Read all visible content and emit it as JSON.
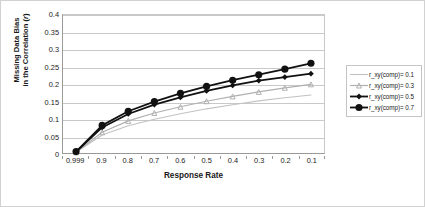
{
  "chart_data": {
    "type": "line",
    "title": "",
    "xlabel": "Response Rate",
    "ylabel_line1": "Missing Data Bias",
    "ylabel_line2": "in the Correlation (r)",
    "ylabel": "Missing Data Bias in the Correlation (r)",
    "categories": [
      "0.999",
      "0.9",
      "0.8",
      "0.7",
      "0.6",
      "0.5",
      "0.4",
      "0.3",
      "0.2",
      "0.1"
    ],
    "ylim": [
      0,
      0.4
    ],
    "yticks": [
      "0",
      "0.05",
      "0.1",
      "0.15",
      "0.2",
      "0.25",
      "0.3",
      "0.35",
      "0.4"
    ],
    "ytick_values": [
      0,
      0.05,
      0.1,
      0.15,
      0.2,
      0.25,
      0.3,
      0.35,
      0.4
    ],
    "grid": true,
    "legend_position": "right",
    "series": [
      {
        "name": "r_xy(comp)= 0.1",
        "values": [
          0.002,
          0.052,
          0.079,
          0.098,
          0.114,
          0.128,
          0.14,
          0.151,
          0.16,
          0.168
        ],
        "color": "#c2c2c2",
        "marker": "none",
        "width": 1.1
      },
      {
        "name": "r_xy(comp)= 0.3",
        "values": [
          0.002,
          0.06,
          0.093,
          0.116,
          0.134,
          0.15,
          0.164,
          0.177,
          0.189,
          0.199
        ],
        "color": "#b0b0b0",
        "marker": "triangle",
        "width": 1.2
      },
      {
        "name": "r_xy(comp)= 0.5",
        "values": [
          0.003,
          0.074,
          0.113,
          0.14,
          0.161,
          0.18,
          0.196,
          0.21,
          0.22,
          0.23
        ],
        "color": "#111111",
        "marker": "diamond",
        "width": 1.8
      },
      {
        "name": "r_xy(comp)= 0.7",
        "values": [
          0.004,
          0.08,
          0.121,
          0.149,
          0.173,
          0.193,
          0.211,
          0.227,
          0.243,
          0.26
        ],
        "color": "#111111",
        "marker": "circle",
        "width": 1.8
      }
    ]
  },
  "legend": {
    "items": [
      {
        "label": "r_xy(comp)= 0.1"
      },
      {
        "label": "r_xy(comp)= 0.3"
      },
      {
        "label": "r_xy(comp)= 0.5"
      },
      {
        "label": "r_xy(comp)= 0.7"
      }
    ]
  },
  "colors": {
    "plot_border": "#9a9a9a",
    "gridline": "#c9c9c9",
    "figure_border": "#d2d2d2",
    "text": "#1a1a1a"
  }
}
